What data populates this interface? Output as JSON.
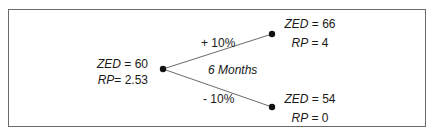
{
  "diagram": {
    "type": "binomial-tree",
    "root": {
      "var1_name": "ZED",
      "var1_value": "60",
      "var2_name": "RP",
      "var2_value": "2.53"
    },
    "edges": {
      "up_label": "+ 10%",
      "down_label": "- 10%",
      "period_label": "6 Months"
    },
    "up_node": {
      "var1_name": "ZED",
      "var1_value": "66",
      "var2_name": "RP",
      "var2_value": "4"
    },
    "down_node": {
      "var1_name": "ZED",
      "var1_value": "54",
      "var2_name": "RP",
      "var2_value": "0"
    },
    "colors": {
      "line": "#6a6a6a",
      "node": "#111111",
      "text": "#1a1a1a",
      "border": "#6a6a6a"
    }
  }
}
